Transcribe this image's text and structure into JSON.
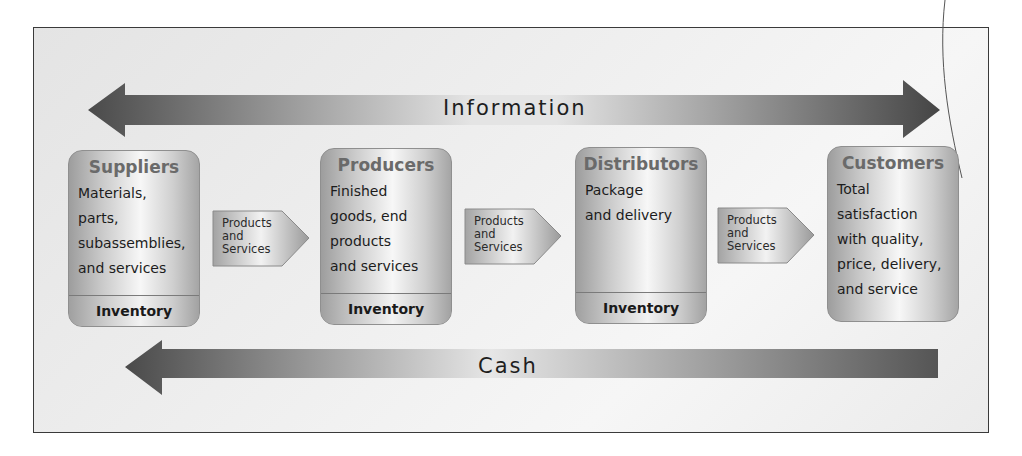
{
  "diagram": {
    "information_arrow": {
      "label": "Information",
      "direction": "bidirectional"
    },
    "cash_arrow": {
      "label": "Cash",
      "direction": "left"
    },
    "stages": [
      {
        "title": "Suppliers",
        "lines": [
          "Materials,",
          "parts,",
          "subassemblies,",
          "and services"
        ],
        "footer": "Inventory"
      },
      {
        "title": "Producers",
        "lines": [
          "Finished",
          "goods, end",
          "products",
          "and services"
        ],
        "footer": "Inventory"
      },
      {
        "title": "Distributors",
        "lines": [
          "Package",
          "and delivery"
        ],
        "footer": "Inventory"
      },
      {
        "title": "Customers",
        "lines": [
          "Total",
          "satisfaction",
          "with quality,",
          "price, delivery,",
          "and service"
        ]
      }
    ],
    "flows": [
      {
        "lines": [
          "Products",
          "and",
          "Services"
        ]
      },
      {
        "lines": [
          "Products",
          "and",
          "Services"
        ]
      },
      {
        "lines": [
          "Products",
          "and",
          "Services"
        ]
      }
    ],
    "colors": {
      "arrow_dark": "#4a4a4a",
      "arrow_light": "#e2e2e2",
      "box_title": "#6a6a6a",
      "frame_border": "#3a3a3a"
    }
  }
}
